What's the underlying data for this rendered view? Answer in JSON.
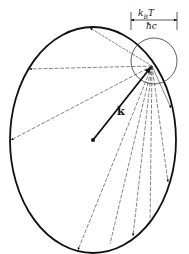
{
  "diagram": {
    "labels": {
      "wavevector": "k",
      "width_numerator_k": "k",
      "width_numerator_sub": "B",
      "width_numerator_T": "T",
      "width_denominator": "ħc"
    },
    "ellipse": {
      "cx": 93,
      "cy": 140,
      "rx": 83,
      "ry": 113
    },
    "small_circle": {
      "cx": 154,
      "cy": 61,
      "r": 23
    },
    "k_vector": {
      "from": [
        93,
        140
      ],
      "to": [
        152,
        66
      ]
    },
    "scatter_origin": [
      152,
      66
    ],
    "scatter_arrow_tips": [
      [
        90,
        28
      ],
      [
        29,
        69
      ],
      [
        11,
        140
      ],
      [
        78,
        250
      ],
      [
        133,
        236
      ],
      [
        168,
        182
      ],
      [
        171,
        108
      ]
    ],
    "width_marker": {
      "x1": 130,
      "x2": 177,
      "y": 20
    },
    "colors": {
      "stroke": "#111111",
      "background": "#ffffff"
    }
  }
}
